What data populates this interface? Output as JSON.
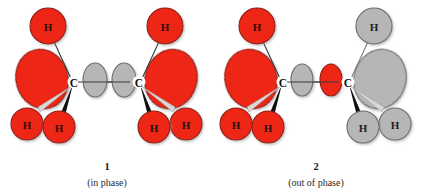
{
  "figure": {
    "kind": "orbital-interaction-diagram",
    "background": "#ffffff",
    "colors": {
      "red_fill": "#ee2617",
      "red_stroke": "#8f1b10",
      "gray_fill": "#b6b6b6",
      "gray_stroke": "#6e6e6e",
      "bond_line": "#3a3a3a",
      "wedge": "#111111",
      "hash": "#cfcfcf",
      "text": "#1a1a1a"
    }
  },
  "structures": [
    {
      "id": "structure-1",
      "caption_number": "1",
      "caption_phase": "(in phase)",
      "center_lobes": [
        {
          "name": "center-lobe-left",
          "color": "gray"
        },
        {
          "name": "center-lobe-right",
          "color": "gray"
        }
      ],
      "left_group": {
        "carbon_label": "C",
        "color": "red",
        "hydrogens": [
          {
            "label": "H",
            "position": "top",
            "bond": "plain"
          },
          {
            "label": "H",
            "position": "bottom-left",
            "bond": "hash"
          },
          {
            "label": "H",
            "position": "bottom-right",
            "bond": "wedge"
          }
        ],
        "back_lobe": {
          "name": "back-lobe",
          "color": "red"
        }
      },
      "right_group": {
        "carbon_label": "C",
        "color": "red",
        "hydrogens": [
          {
            "label": "H",
            "position": "top",
            "bond": "plain"
          },
          {
            "label": "H",
            "position": "bottom-left",
            "bond": "wedge"
          },
          {
            "label": "H",
            "position": "bottom-right",
            "bond": "hash"
          }
        ],
        "back_lobe": {
          "name": "back-lobe",
          "color": "red"
        }
      }
    },
    {
      "id": "structure-2",
      "caption_number": "2",
      "caption_phase": "(out of phase)",
      "center_lobes": [
        {
          "name": "center-lobe-left",
          "color": "gray"
        },
        {
          "name": "center-lobe-right",
          "color": "red"
        }
      ],
      "left_group": {
        "carbon_label": "C",
        "color": "red",
        "hydrogens": [
          {
            "label": "H",
            "position": "top",
            "bond": "plain"
          },
          {
            "label": "H",
            "position": "bottom-left",
            "bond": "hash"
          },
          {
            "label": "H",
            "position": "bottom-right",
            "bond": "wedge"
          }
        ],
        "back_lobe": {
          "name": "back-lobe",
          "color": "red"
        }
      },
      "right_group": {
        "carbon_label": "C",
        "color": "gray",
        "hydrogens": [
          {
            "label": "H",
            "position": "top",
            "bond": "plain"
          },
          {
            "label": "H",
            "position": "bottom-left",
            "bond": "wedge"
          },
          {
            "label": "H",
            "position": "bottom-right",
            "bond": "hash"
          }
        ],
        "back_lobe": {
          "name": "back-lobe",
          "color": "gray"
        }
      }
    }
  ]
}
